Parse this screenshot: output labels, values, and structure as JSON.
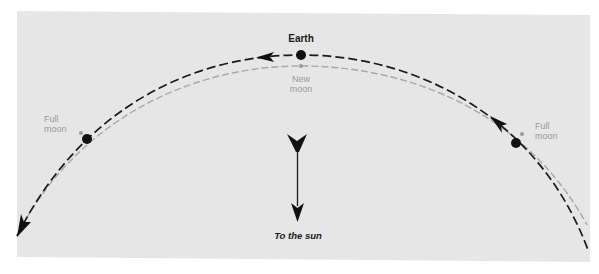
{
  "diagram": {
    "background_color": "#e6e6e6",
    "page_color": "#ffffff",
    "colors": {
      "earth_orbit": "#1a1a1a",
      "moon_orbit": "#a6a6a6",
      "earth_dot": "#111111",
      "moon_dot": "#a0a0a0",
      "label_dark": "#1a1a1a",
      "label_gray": "#9a9a9a"
    },
    "orbits": [
      {
        "name": "earth-orbit",
        "style": "dashed",
        "color": "#1a1a1a",
        "direction": "right-to-left"
      },
      {
        "name": "moon-orbit",
        "style": "dashed",
        "color": "#a6a6a6"
      }
    ],
    "bodies": [
      {
        "name": "earth",
        "label": "Earth",
        "position": "top-center"
      },
      {
        "name": "earth-left",
        "label": "",
        "position": "left"
      },
      {
        "name": "earth-right",
        "label": "",
        "position": "right"
      }
    ],
    "moon_phases": [
      {
        "position": "left",
        "line1": "Full",
        "line2": "moon"
      },
      {
        "position": "top-center",
        "line1": "New",
        "line2": "moon"
      },
      {
        "position": "right",
        "line1": "Full",
        "line2": "moon"
      }
    ],
    "labels": {
      "earth": "Earth",
      "new_moon_line1": "New",
      "new_moon_line2": "moon",
      "full_moon_left_line1": "Full",
      "full_moon_left_line2": "moon",
      "full_moon_right_line1": "Full",
      "full_moon_right_line2": "moon",
      "sun_direction": "To the sun"
    },
    "sun_arrow": {
      "direction": "down",
      "label": "To the sun"
    }
  }
}
